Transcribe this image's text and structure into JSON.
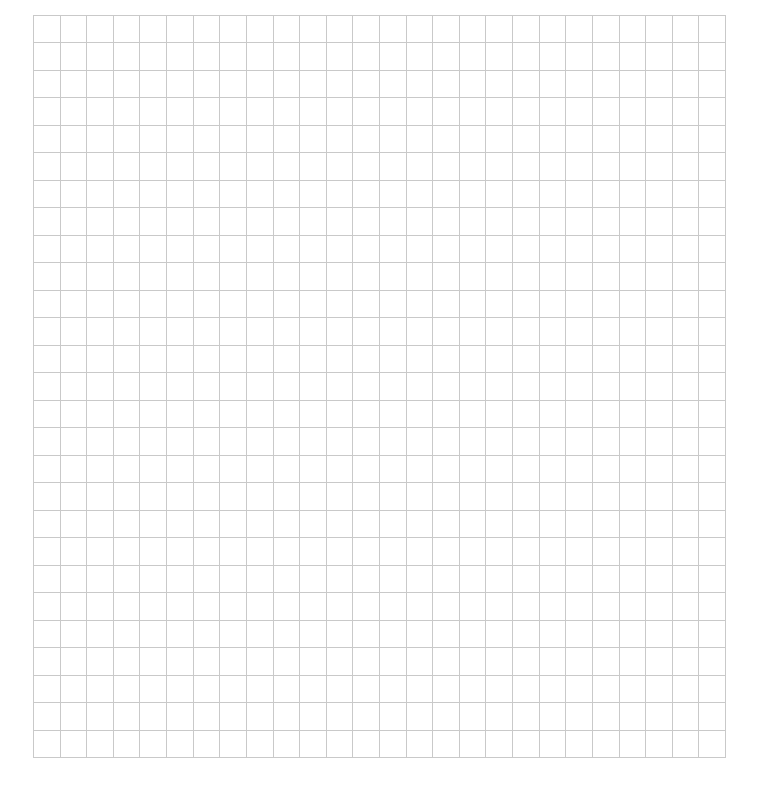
{
  "grid": {
    "columns": 26,
    "rows": 27,
    "line_color": "#c9c9c9",
    "background_color": "#ffffff",
    "cells_filled": []
  }
}
